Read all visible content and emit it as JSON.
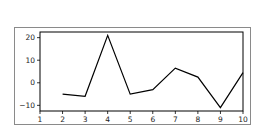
{
  "chart_data": {
    "type": "line",
    "title": "",
    "xlabel": "",
    "ylabel": "",
    "x": [
      2,
      3,
      4,
      5,
      6,
      7,
      8,
      9,
      10
    ],
    "series": [
      {
        "name": "series",
        "values": [
          -5,
          -6,
          21,
          -5,
          -3,
          6.5,
          2.5,
          -11,
          4.5
        ],
        "color": "#000000"
      }
    ],
    "xlim": [
      1,
      10
    ],
    "ylim": [
      -12.5,
      22.5
    ],
    "xticks": [
      "1",
      "2",
      "3",
      "4",
      "5",
      "6",
      "7",
      "8",
      "9",
      "10"
    ],
    "yticks": [
      "20",
      "10",
      "0",
      "−10"
    ],
    "grid": false,
    "legend": null
  }
}
